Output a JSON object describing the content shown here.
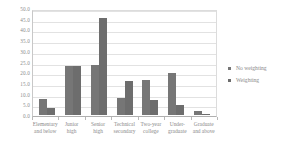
{
  "chart_data": {
    "type": "bar",
    "title": "",
    "xlabel": "",
    "ylabel": "",
    "ylim": [
      0.0,
      50.0
    ],
    "ytick_step": 5.0,
    "ytick_labels": [
      "0.0",
      "5.0",
      "10.0",
      "15.0",
      "20.0",
      "25.0",
      "30.0",
      "35.0",
      "40.0",
      "45.0",
      "50.0"
    ],
    "ytick_values": [
      0.0,
      5.0,
      10.0,
      15.0,
      20.0,
      25.0,
      30.0,
      35.0,
      40.0,
      45.0,
      50.0
    ],
    "grid": true,
    "grid_axis": "y",
    "legend_position": "right",
    "categories": [
      "Elementary and below",
      "Junior high",
      "Senior high",
      "Technical secondary",
      "Two-year college",
      "Under-graduate",
      "Graduate and above"
    ],
    "category_lines": [
      [
        "Elementary",
        "and below"
      ],
      [
        "Junior",
        "high"
      ],
      [
        "Senior",
        "high"
      ],
      [
        "Technical",
        "secondary"
      ],
      [
        "Two-year",
        "college"
      ],
      [
        "Under-",
        "graduate"
      ],
      [
        "Graduate",
        "and above"
      ]
    ],
    "series": [
      {
        "name": "No weighting",
        "color": "#767676",
        "values": [
          7.5,
          23.0,
          23.5,
          8.0,
          16.5,
          19.5,
          1.7
        ]
      },
      {
        "name": "Weighting",
        "color": "#6d6d6d",
        "values": [
          3.5,
          23.0,
          45.5,
          16.0,
          7.0,
          4.5,
          0.5
        ]
      }
    ]
  },
  "legend": {
    "items": [
      {
        "label": "No weighting"
      },
      {
        "label": "Weighting"
      }
    ]
  }
}
